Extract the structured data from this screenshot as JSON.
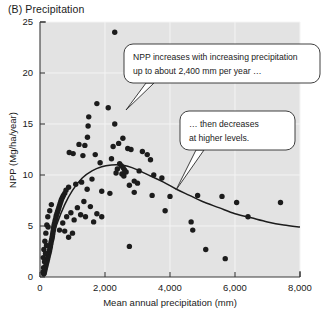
{
  "panel": {
    "label": "(B)  Precipitation"
  },
  "chart_data": {
    "type": "scatter",
    "title": "(B) Precipitation",
    "xlabel": "Mean annual precipitation (mm)",
    "ylabel": "NPP (Mg/ha/year)",
    "xlim": [
      0,
      8000
    ],
    "ylim": [
      0,
      25
    ],
    "xticks": [
      0,
      2000,
      4000,
      6000,
      8000
    ],
    "xtick_labels": [
      "0",
      "2,000",
      "4,000",
      "6,000",
      "8,000"
    ],
    "yticks": [
      0,
      5,
      10,
      15,
      20,
      25
    ],
    "ytick_labels": [
      "0",
      "5",
      "10",
      "15",
      "20",
      "25"
    ],
    "grid": true,
    "legend": "none",
    "series": [
      {
        "name": "Sites",
        "marker": "filled-circle",
        "color": "#1c1c1c",
        "points": [
          [
            2300,
            24.0
          ],
          [
            1750,
            17.0
          ],
          [
            2100,
            16.6
          ],
          [
            1500,
            15.7
          ],
          [
            1480,
            14.8
          ],
          [
            2300,
            15.0
          ],
          [
            1460,
            13.7
          ],
          [
            2550,
            13.6
          ],
          [
            2420,
            13.1
          ],
          [
            1200,
            13.0
          ],
          [
            1380,
            12.9
          ],
          [
            2250,
            12.8
          ],
          [
            2700,
            12.6
          ],
          [
            2800,
            12.5
          ],
          [
            900,
            12.2
          ],
          [
            1020,
            12.1
          ],
          [
            1700,
            12.0
          ],
          [
            1320,
            11.9
          ],
          [
            2200,
            11.6
          ],
          [
            3150,
            12.3
          ],
          [
            3300,
            12.0
          ],
          [
            3400,
            11.5
          ],
          [
            1850,
            11.2
          ],
          [
            2450,
            11.1
          ],
          [
            2500,
            10.9
          ],
          [
            2560,
            10.7
          ],
          [
            2600,
            10.5
          ],
          [
            2650,
            10.3
          ],
          [
            2520,
            10.1
          ],
          [
            2580,
            9.9
          ],
          [
            2380,
            10.6
          ],
          [
            2340,
            10.2
          ],
          [
            3050,
            10.4
          ],
          [
            3500,
            10.0
          ],
          [
            3750,
            9.7
          ],
          [
            2900,
            9.4
          ],
          [
            3000,
            9.2
          ],
          [
            2750,
            9.0
          ],
          [
            1600,
            9.6
          ],
          [
            1280,
            9.3
          ],
          [
            1100,
            9.1
          ],
          [
            1450,
            8.6
          ],
          [
            1900,
            8.4
          ],
          [
            2150,
            8.2
          ],
          [
            880,
            8.8
          ],
          [
            800,
            8.5
          ],
          [
            760,
            8.2
          ],
          [
            720,
            8.0
          ],
          [
            690,
            7.8
          ],
          [
            660,
            7.6
          ],
          [
            640,
            7.4
          ],
          [
            620,
            7.2
          ],
          [
            600,
            7.0
          ],
          [
            580,
            6.8
          ],
          [
            560,
            6.6
          ],
          [
            540,
            6.4
          ],
          [
            520,
            6.2
          ],
          [
            500,
            6.0
          ],
          [
            490,
            5.8
          ],
          [
            470,
            5.6
          ],
          [
            460,
            5.4
          ],
          [
            440,
            5.2
          ],
          [
            430,
            5.0
          ],
          [
            420,
            4.8
          ],
          [
            410,
            4.6
          ],
          [
            400,
            4.4
          ],
          [
            390,
            4.2
          ],
          [
            380,
            4.0
          ],
          [
            370,
            3.8
          ],
          [
            355,
            3.6
          ],
          [
            340,
            3.4
          ],
          [
            330,
            3.2
          ],
          [
            320,
            3.0
          ],
          [
            305,
            2.8
          ],
          [
            295,
            2.6
          ],
          [
            280,
            2.4
          ],
          [
            265,
            2.2
          ],
          [
            250,
            2.0
          ],
          [
            235,
            1.8
          ],
          [
            220,
            1.6
          ],
          [
            205,
            1.4
          ],
          [
            190,
            1.2
          ],
          [
            175,
            1.0
          ],
          [
            160,
            0.8
          ],
          [
            145,
            0.6
          ],
          [
            130,
            0.4
          ],
          [
            115,
            0.3
          ],
          [
            100,
            1.9
          ],
          [
            120,
            2.7
          ],
          [
            150,
            3.5
          ],
          [
            180,
            4.3
          ],
          [
            210,
            5.1
          ],
          [
            240,
            5.9
          ],
          [
            300,
            6.5
          ],
          [
            350,
            7.1
          ],
          [
            250,
            4.9
          ],
          [
            200,
            3.1
          ],
          [
            170,
            2.3
          ],
          [
            140,
            1.5
          ],
          [
            110,
            0.9
          ],
          [
            95,
            0.5
          ],
          [
            600,
            4.6
          ],
          [
            700,
            5.3
          ],
          [
            820,
            5.9
          ],
          [
            950,
            6.3
          ],
          [
            1050,
            5.6
          ],
          [
            1150,
            6.8
          ],
          [
            1250,
            6.1
          ],
          [
            1350,
            7.4
          ],
          [
            1400,
            5.9
          ],
          [
            1550,
            6.9
          ],
          [
            1650,
            5.4
          ],
          [
            1750,
            6.2
          ],
          [
            1900,
            5.9
          ],
          [
            1000,
            4.3
          ],
          [
            880,
            3.9
          ],
          [
            760,
            4.5
          ],
          [
            2750,
            3.0
          ],
          [
            2900,
            8.3
          ],
          [
            3450,
            8.0
          ],
          [
            3850,
            6.5
          ],
          [
            4000,
            7.9
          ],
          [
            4650,
            5.4
          ],
          [
            4700,
            4.6
          ],
          [
            4850,
            8.0
          ],
          [
            5100,
            2.7
          ],
          [
            5600,
            7.9
          ],
          [
            5700,
            1.8
          ],
          [
            6050,
            7.3
          ],
          [
            6400,
            5.9
          ],
          [
            7400,
            7.3
          ]
        ]
      }
    ],
    "fit_curve": {
      "name": "Fitted response",
      "description": "Hump-shaped curve rising steeply to a peak near 2,400 mm then declining",
      "peak_x": 2400,
      "peak_y": 11.0,
      "points": [
        [
          60,
          0.2
        ],
        [
          300,
          3.0
        ],
        [
          520,
          5.2
        ],
        [
          760,
          7.1
        ],
        [
          1000,
          8.5
        ],
        [
          1300,
          9.7
        ],
        [
          1600,
          10.4
        ],
        [
          1900,
          10.8
        ],
        [
          2200,
          10.98
        ],
        [
          2400,
          11.0
        ],
        [
          2700,
          10.85
        ],
        [
          3000,
          10.5
        ],
        [
          3400,
          9.9
        ],
        [
          3800,
          9.3
        ],
        [
          4200,
          8.6
        ],
        [
          4600,
          8.0
        ],
        [
          5000,
          7.4
        ],
        [
          5500,
          6.8
        ],
        [
          6000,
          6.2
        ],
        [
          6500,
          5.8
        ],
        [
          7000,
          5.4
        ],
        [
          7500,
          5.1
        ],
        [
          8000,
          4.9
        ]
      ]
    },
    "annotations": [
      {
        "id": "callout-increase",
        "lines": [
          "NPP increases with increasing precipitation",
          "up to about 2,400 mm per year …"
        ],
        "points_to_x": 1450,
        "points_to_y": 13.5
      },
      {
        "id": "callout-decrease",
        "lines": [
          "… then decreases",
          "at higher levels."
        ],
        "points_to_x": 4200,
        "points_to_y": 8.6
      }
    ]
  }
}
